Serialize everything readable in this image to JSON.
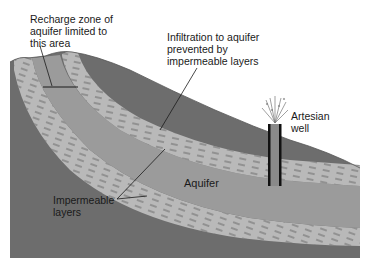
{
  "diagram": {
    "labels": {
      "recharge_zone": "Recharge zone of\naquifer limited to\nthis area",
      "infiltration": "Infiltration to aquifer\nprevented by\nimpermeable layers",
      "artesian_well": "Artesian\nwell",
      "aquifer": "Aquifer",
      "impermeable_layers": "Impermeable\nlayers"
    },
    "colors": {
      "ground": "#6d6d6d",
      "impermeable_layer": "#b9b9b9",
      "aquifer": "#9b9b9b",
      "well_casing": "#111111",
      "well_water": "#8a8a8a",
      "background": "#ffffff"
    }
  }
}
